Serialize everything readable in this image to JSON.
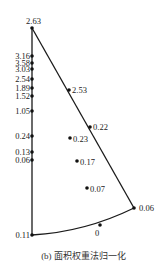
{
  "caption": "(b) 面积权重法归一化",
  "colors": {
    "line": "#1a1a1a",
    "point": "#111111",
    "text": "#222222"
  },
  "apex": {
    "label": "2.63",
    "x": 32,
    "y": 28
  },
  "corner": {
    "label": "0.06",
    "x": 134,
    "y": 208
  },
  "bottom_left": {
    "label": "0.11",
    "x": 32,
    "y": 235
  },
  "axis_points": [
    {
      "label": "3.16",
      "y": 56
    },
    {
      "label": "3.58",
      "y": 63
    },
    {
      "label": "3.03",
      "y": 69
    },
    {
      "label": "2.54",
      "y": 79
    },
    {
      "label": "1.89",
      "y": 88
    },
    {
      "label": "1.52",
      "y": 96
    },
    {
      "label": "1.05",
      "y": 111
    },
    {
      "label": "0.24",
      "y": 136
    },
    {
      "label": "0.13",
      "y": 152
    },
    {
      "label": "0.06",
      "y": 160
    }
  ],
  "edge_points": [
    {
      "label": "2.53",
      "x": 69,
      "y": 90
    },
    {
      "label": "0.22",
      "x": 90,
      "y": 127
    }
  ],
  "interior_points": [
    {
      "label": "0.23",
      "x": 70,
      "y": 138
    },
    {
      "label": "0.17",
      "x": 77,
      "y": 161
    },
    {
      "label": "0.07",
      "x": 87,
      "y": 188
    }
  ],
  "arc_point": {
    "label": "0",
    "x": 100,
    "y": 225
  }
}
